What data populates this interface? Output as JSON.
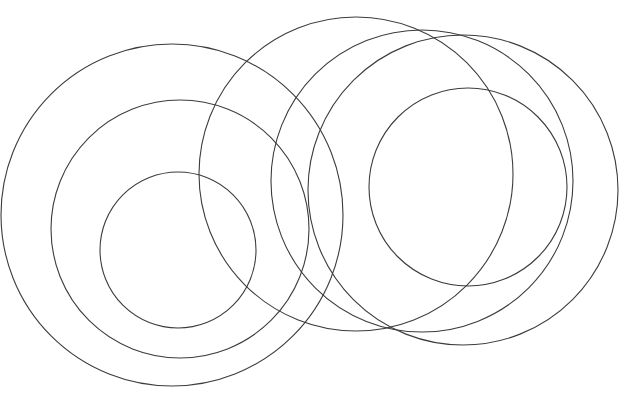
{
  "figure": {
    "type": "line-drawing",
    "width": 634,
    "height": 406,
    "background_color": "#ffffff",
    "stroke_color": "#3c3c3c",
    "stroke_width": 1.1,
    "fill": "none",
    "circle_count": 7
  },
  "chart_data": {
    "type": "scatter",
    "xlabel": "",
    "ylabel": "",
    "xlim": [
      0,
      634
    ],
    "ylim": [
      0,
      406
    ],
    "grid": false,
    "legend": "none",
    "units": "pixels",
    "coordinate_origin": "top-left",
    "circles": [
      {
        "id": "left-outer",
        "label": "Left cluster — outer circle",
        "cluster": "left",
        "cx": 172,
        "cy": 215,
        "r": 171,
        "stroke": "#3c3c3c",
        "stroke_width": 1.1
      },
      {
        "id": "left-middle",
        "label": "Left cluster — middle circle",
        "cluster": "left",
        "cx": 180,
        "cy": 229,
        "r": 129,
        "stroke": "#3c3c3c",
        "stroke_width": 1.1
      },
      {
        "id": "left-inner",
        "label": "Left cluster — inner circle",
        "cluster": "left",
        "cx": 178,
        "cy": 250,
        "r": 78,
        "stroke": "#3c3c3c",
        "stroke_width": 1.1
      },
      {
        "id": "right-a",
        "label": "Right cluster — upper-left circle",
        "cluster": "right",
        "cx": 356,
        "cy": 174,
        "r": 157,
        "stroke": "#3c3c3c",
        "stroke_width": 1.1
      },
      {
        "id": "right-b",
        "label": "Right cluster — upper-middle circle",
        "cluster": "right",
        "cx": 422,
        "cy": 181,
        "r": 151,
        "stroke": "#3c3c3c",
        "stroke_width": 1.1
      },
      {
        "id": "right-c",
        "label": "Right cluster — outer-right circle",
        "cluster": "right",
        "cx": 463,
        "cy": 190,
        "r": 155,
        "stroke": "#3c3c3c",
        "stroke_width": 1.1
      },
      {
        "id": "right-d",
        "label": "Right cluster — small inner circle",
        "cluster": "right",
        "cx": 468,
        "cy": 187,
        "r": 99,
        "stroke": "#3c3c3c",
        "stroke_width": 1.1
      }
    ],
    "extents": {
      "leftmost_x": 38,
      "rightmost_x": 618,
      "topmost_y": 17,
      "bottommost_y": 386
    }
  }
}
